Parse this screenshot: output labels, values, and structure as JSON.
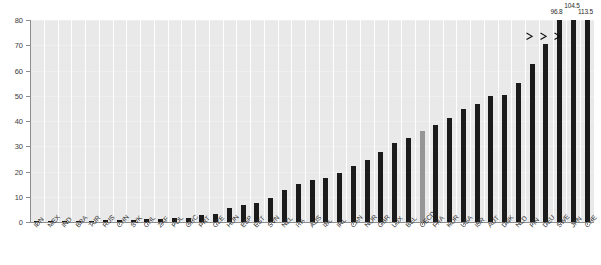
{
  "chart_data": {
    "type": "bar",
    "title": "",
    "subtitle": "",
    "xlabel": "",
    "ylabel": "",
    "ylim": [
      0,
      80
    ],
    "yticks": [
      0,
      10,
      20,
      30,
      40,
      50,
      60,
      70,
      80
    ],
    "grid": "vertical-white-gridlines",
    "legend": "none",
    "axis_clipped": true,
    "clip_value": 80,
    "note": "Three right-most bars exceed the axis maximum and are drawn clipped with break arrows and printed value labels.",
    "categories": [
      "IDN",
      "MEX",
      "IND",
      "BRA",
      "TUR",
      "RUS",
      "CHN",
      "SVK",
      "CHL",
      "ZAF",
      "POL",
      "GRC",
      "PRT",
      "CZE",
      "HUN",
      "ESP",
      "EST",
      "SVN",
      "NZL",
      "ITA",
      "AUS",
      "ISL",
      "IRL",
      "CAN",
      "NOR",
      "GBR",
      "LUX",
      "BEL",
      "OECD",
      "FRA",
      "KOR",
      "USA",
      "ISR",
      "AUT",
      "DNK",
      "NLD",
      "FIN",
      "DEU",
      "SWE",
      "JPN",
      "CHE"
    ],
    "values": [
      0.2,
      0.3,
      0.4,
      0.5,
      0.6,
      0.7,
      0.8,
      0.9,
      1.0,
      1.2,
      1.4,
      1.6,
      2.6,
      3.3,
      5.4,
      6.6,
      7.6,
      9.4,
      12.6,
      15.0,
      16.6,
      17.6,
      19.5,
      22.2,
      24.4,
      27.6,
      31.4,
      33.4,
      36.2,
      38.6,
      41.0,
      44.6,
      46.6,
      49.8,
      50.4,
      55.0,
      62.6,
      70.4,
      96.8,
      104.5,
      113.5
    ],
    "highlight_category": "OECD",
    "highlight_color": "#969696",
    "bar_color": "#1b1b1b",
    "plot_background": "#e9e9e9",
    "gridline_color": "#ffffff",
    "clipped_labels": [
      {
        "category": "SWE",
        "label": "96.8",
        "value": 96.8
      },
      {
        "category": "JPN",
        "label": "104.5",
        "value": 104.5
      },
      {
        "category": "CHE",
        "label": "113.5",
        "value": 113.5
      }
    ]
  },
  "caption": {
    "text": ""
  }
}
